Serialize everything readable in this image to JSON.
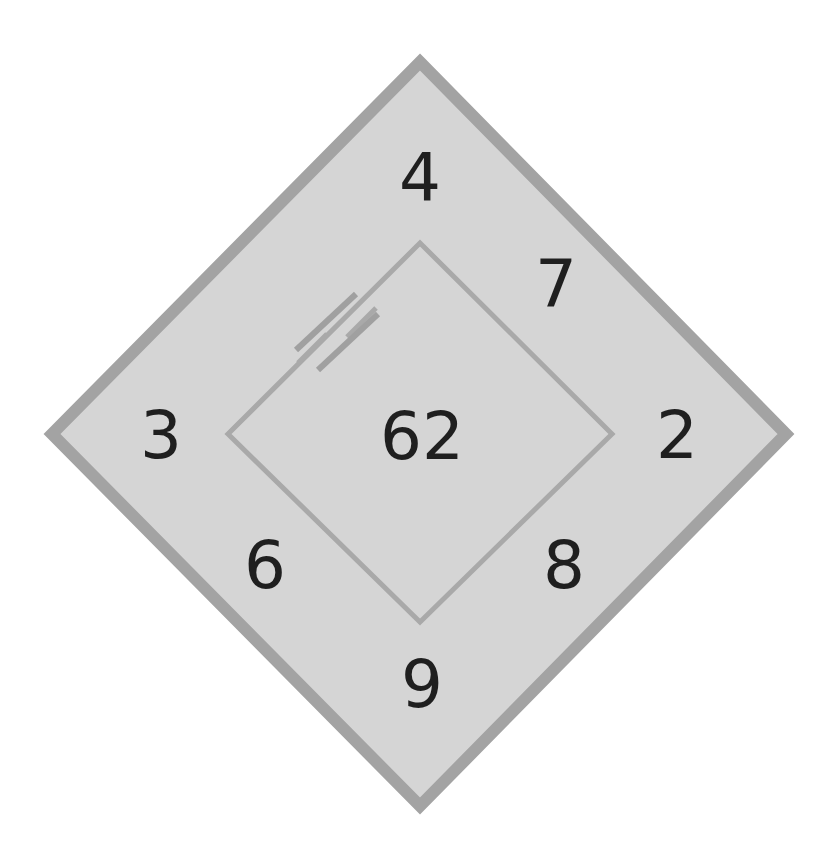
{
  "figure": {
    "title": "",
    "kind": "circuit-diagram-nested-diamonds"
  },
  "colors": {
    "background": "#ffffff",
    "outer_fill": "#d5d5d5",
    "outer_stroke": "#a3a3a3",
    "inner_stroke": "#a9a9a9",
    "symbol_stroke": "#a0a0a0",
    "label_text": "#1f1f1f"
  },
  "shapes": {
    "outer_diamond": {
      "name": "outer-diamond",
      "top": [
        420,
        62
      ],
      "right": [
        786,
        434
      ],
      "bottom": [
        420,
        806
      ],
      "left": [
        52,
        434
      ],
      "stroke_width": 12,
      "fill": "#d5d5d5",
      "stroke": "#a3a3a3"
    },
    "inner_diamond": {
      "name": "inner-diamond",
      "top": [
        420,
        243
      ],
      "right": [
        612,
        434
      ],
      "bottom": [
        420,
        622
      ],
      "left": [
        228,
        434
      ],
      "stroke_width": 5,
      "fill": "none",
      "stroke": "#a9a9a9"
    },
    "capacitor": {
      "name": "capacitor-symbol",
      "edge": "upper-left",
      "plate_count": 2,
      "stroke_width": 6,
      "stroke": "#a0a0a0",
      "plate_a": {
        "x1": 296,
        "y1": 350,
        "x2": 356,
        "y2": 294
      },
      "plate_b": {
        "x1": 318,
        "y1": 370,
        "x2": 378,
        "y2": 314
      },
      "lead_a": {
        "x1": 298,
        "y1": 363,
        "x2": 327,
        "y2": 334
      },
      "lead_b": {
        "x1": 347,
        "y1": 337,
        "x2": 376,
        "y2": 308
      }
    }
  },
  "labels": {
    "top": {
      "name": "label-top",
      "value": "4",
      "x": 420,
      "y": 178
    },
    "upper_right": {
      "name": "label-upper-right",
      "value": "7",
      "x": 556,
      "y": 285
    },
    "right": {
      "name": "label-right",
      "value": "2",
      "x": 677,
      "y": 436
    },
    "lower_right": {
      "name": "label-lower-right",
      "value": "8",
      "x": 564,
      "y": 566
    },
    "bottom": {
      "name": "label-bottom",
      "value": "9",
      "x": 422,
      "y": 685
    },
    "lower_left": {
      "name": "label-lower-left",
      "value": "6",
      "x": 265,
      "y": 566
    },
    "left": {
      "name": "label-left",
      "value": "3",
      "x": 161,
      "y": 436
    },
    "center": {
      "name": "label-center",
      "value": "62",
      "x": 422,
      "y": 437
    }
  }
}
